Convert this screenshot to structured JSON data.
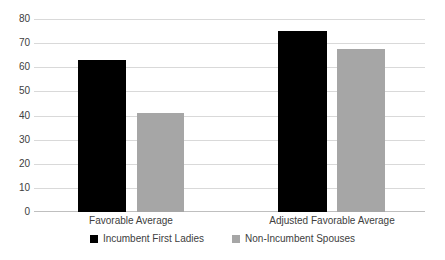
{
  "chart_data": {
    "type": "bar",
    "title": "",
    "subtitle": "",
    "xlabel": "",
    "ylabel": "",
    "categories": [
      "Favorable Average",
      "Adjusted Favorable Average"
    ],
    "series": [
      {
        "name": "Incumbent First Ladies",
        "color": "#000000",
        "values": [
          63,
          75
        ]
      },
      {
        "name": "Non-Incumbent Spouses",
        "color": "#A6A6A6",
        "values": [
          41,
          67.5
        ]
      }
    ],
    "ylim": [
      0,
      80
    ],
    "ytick_values": [
      0,
      10,
      20,
      30,
      40,
      50,
      60,
      70,
      80
    ],
    "ytick_labels": [
      "0",
      "10",
      "20",
      "30",
      "40",
      "50",
      "60",
      "70",
      "80"
    ],
    "grid": true,
    "grid_axis": "y",
    "legend_position": "bottom",
    "annotations": []
  },
  "style": {
    "background": "#FFFFFF",
    "gridline_color": "#D9D9D9",
    "baseline_color": "#BFBFBF",
    "text_color": "#404040"
  }
}
